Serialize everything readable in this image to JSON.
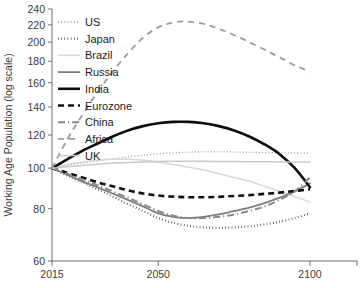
{
  "chart_data": {
    "type": "line",
    "title": "Working age population projections by country",
    "xlabel": "",
    "ylabel": "Working Age Population (log scale)",
    "x": [
      2015,
      2020,
      2025,
      2030,
      2035,
      2040,
      2045,
      2050,
      2055,
      2060,
      2065,
      2070,
      2075,
      2080,
      2085,
      2090,
      2095,
      2100
    ],
    "xticks": [
      2015,
      2050,
      2100
    ],
    "xtick_labels": [
      "2015",
      "2050",
      "2100"
    ],
    "xlim": [
      2015,
      2100
    ],
    "yticks": [
      60,
      80,
      100,
      120,
      140,
      160,
      180,
      200,
      220,
      240
    ],
    "ytick_labels": [
      "60",
      "80",
      "100",
      "120",
      "140",
      "160",
      "180",
      "200",
      "220",
      "240"
    ],
    "ylim": [
      60,
      240
    ],
    "y_scale": "log",
    "grid": false,
    "legend_position": "top-left",
    "series": [
      {
        "name": "US",
        "style": "dotted-fine",
        "color": "#9a9a9a",
        "width": 1.3,
        "dash": "1,2.2",
        "values": [
          100,
          101.5,
          102.8,
          104,
          105.2,
          106.4,
          107.4,
          108.2,
          108.8,
          109.2,
          109.4,
          109.4,
          109.3,
          109.1,
          108.9,
          108.8,
          108.7,
          108.6
        ]
      },
      {
        "name": "Japan",
        "style": "dotted-bold",
        "color": "#1a1a1a",
        "width": 2.2,
        "dash": "0.6,2.6",
        "values": [
          100,
          96,
          92.5,
          89,
          85.5,
          82,
          79,
          76,
          74,
          72.8,
          72.2,
          72,
          72.2,
          72.6,
          73.4,
          74.5,
          76,
          78
        ]
      },
      {
        "name": "Brazil",
        "style": "solid-light",
        "color": "#d6d6d6",
        "width": 1.5,
        "dash": "none",
        "values": [
          100,
          102,
          103.5,
          104.5,
          105,
          105,
          104.5,
          103.5,
          102,
          100.5,
          99,
          97,
          95,
          93,
          90.5,
          88,
          85.5,
          83
        ]
      },
      {
        "name": "Russia",
        "style": "solid-medium",
        "color": "#7d7d7d",
        "width": 1.8,
        "dash": "none",
        "values": [
          100,
          96.5,
          93,
          90,
          87,
          84,
          81,
          78,
          76.5,
          76,
          76.5,
          77.5,
          79,
          80.5,
          82.5,
          85,
          88,
          92
        ]
      },
      {
        "name": "India",
        "style": "solid-thick",
        "color": "#0d0d0d",
        "width": 2.6,
        "dash": "none",
        "values": [
          100,
          105,
          110,
          114.5,
          119,
          123,
          126,
          128,
          129,
          129,
          128,
          126,
          123,
          119,
          114,
          108,
          100,
          90
        ]
      },
      {
        "name": "Eurozone",
        "style": "dashed-thick",
        "color": "#111111",
        "width": 2.6,
        "dash": "6,4",
        "values": [
          100,
          97.5,
          95,
          92.5,
          90.5,
          88.5,
          87,
          86,
          85.5,
          85.2,
          85.2,
          85.4,
          85.8,
          86.2,
          86.8,
          87.4,
          88.2,
          89
        ]
      },
      {
        "name": "China",
        "style": "dash-dot",
        "color": "#8a8a8a",
        "width": 2.0,
        "dash": "7,3,1.2,3",
        "values": [
          100,
          97,
          94,
          91,
          88,
          85,
          82,
          79,
          77,
          76,
          76,
          76.5,
          77.5,
          79,
          81,
          84,
          88,
          95
        ]
      },
      {
        "name": "Africa",
        "style": "dashed",
        "color": "#9a9a9a",
        "width": 1.8,
        "dash": "6,5",
        "values": [
          100,
          117,
          134,
          152,
          170,
          188,
          205,
          217,
          223,
          224,
          221,
          215,
          208,
          200,
          192,
          184,
          176,
          170
        ]
      },
      {
        "name": "UK",
        "style": "solid-pale",
        "color": "#c9c9c9",
        "width": 1.5,
        "dash": "none",
        "values": [
          100,
          100.8,
          101.5,
          102.2,
          102.8,
          103.2,
          103.5,
          103.7,
          103.8,
          103.8,
          103.8,
          103.7,
          103.7,
          103.6,
          103.6,
          103.5,
          103.5,
          103.4
        ]
      }
    ]
  }
}
